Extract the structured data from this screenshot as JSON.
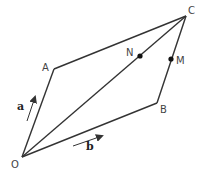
{
  "diagram": {
    "type": "vector-geometry",
    "shape": "parallelogram OACB with diagonal OC",
    "colors": {
      "line": "#333333",
      "label": "#444444",
      "dot": "#111111"
    },
    "points": [
      {
        "name": "O",
        "label": "O",
        "x": 22,
        "y": 157
      },
      {
        "name": "A",
        "label": "A",
        "x": 54,
        "y": 69
      },
      {
        "name": "C",
        "label": "C",
        "x": 186,
        "y": 16
      },
      {
        "name": "B",
        "label": "B",
        "x": 157,
        "y": 103
      },
      {
        "name": "N",
        "label": "N",
        "x": 140,
        "y": 56,
        "on": "OC"
      },
      {
        "name": "M",
        "label": "M",
        "x": 171,
        "y": 59,
        "on": "BC"
      }
    ],
    "segments": [
      "OA",
      "AC",
      "CB",
      "BO",
      "OC"
    ],
    "vectors": [
      {
        "name": "a",
        "label": "a",
        "parallel_to": "OA"
      },
      {
        "name": "b",
        "label": "b",
        "parallel_to": "OB"
      }
    ]
  }
}
